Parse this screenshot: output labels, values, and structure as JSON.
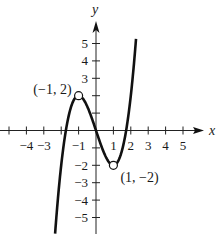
{
  "chart_data": {
    "type": "line",
    "title": "",
    "xlabel": "x",
    "ylabel": "y",
    "function": "f(x) = x^3 - 3x",
    "xlim": [
      -5,
      5
    ],
    "ylim": [
      -5,
      5
    ],
    "grid": false,
    "legend": null,
    "x_ticks": [
      -5,
      -4,
      -3,
      -2,
      -1,
      1,
      2,
      3,
      4,
      5
    ],
    "x_tick_labels": [
      {
        "value": -4,
        "label": "−4"
      },
      {
        "value": -3,
        "label": "−3"
      },
      {
        "value": -1,
        "label": "−1"
      },
      {
        "value": 1,
        "label": "1"
      },
      {
        "value": 2,
        "label": "2"
      },
      {
        "value": 3,
        "label": "3"
      },
      {
        "value": 4,
        "label": "4"
      },
      {
        "value": 5,
        "label": "5"
      }
    ],
    "y_ticks": [
      -5,
      -4,
      -3,
      -2,
      -1,
      1,
      2,
      3,
      4,
      5
    ],
    "y_tick_labels": [
      {
        "value": 5,
        "label": "5"
      },
      {
        "value": 4,
        "label": "4"
      },
      {
        "value": 3,
        "label": "3"
      },
      {
        "value": -2,
        "label": "−2"
      },
      {
        "value": -3,
        "label": "−3"
      },
      {
        "value": -4,
        "label": "−4"
      },
      {
        "value": -5,
        "label": "−5"
      }
    ],
    "curve_domain": [
      -2.35,
      2.3
    ],
    "points": [
      {
        "x": -1,
        "y": 2,
        "label": "(−1, 2)",
        "style": "open-circle"
      },
      {
        "x": 1,
        "y": -2,
        "label": "(1, −2)",
        "style": "open-circle"
      }
    ],
    "sample_points": [
      {
        "x": -2.35,
        "y": -5.93
      },
      {
        "x": -2,
        "y": -2
      },
      {
        "x": -1.73,
        "y": 0
      },
      {
        "x": -1,
        "y": 2
      },
      {
        "x": 0,
        "y": 0
      },
      {
        "x": 1,
        "y": -2
      },
      {
        "x": 1.73,
        "y": 0
      },
      {
        "x": 2,
        "y": 2
      },
      {
        "x": 2.3,
        "y": 5.27
      }
    ]
  },
  "colors": {
    "curve": "#111111",
    "axis": "#222222",
    "background": "#ffffff"
  }
}
